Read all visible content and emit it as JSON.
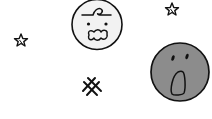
{
  "scene": {
    "background": "#ffffff",
    "stroke_color": "#111111",
    "elements": [
      {
        "type": "face",
        "name": "worried-face",
        "fill": "#f2f2f2",
        "cx": 97,
        "cy": 24,
        "r": 25
      },
      {
        "type": "face",
        "name": "surprised-face",
        "fill": "#8c8c8c",
        "cx": 180,
        "cy": 72,
        "r": 28
      },
      {
        "type": "star",
        "name": "star-left",
        "cx": 21,
        "cy": 40
      },
      {
        "type": "star",
        "name": "star-top-right",
        "cx": 172,
        "cy": 9
      },
      {
        "type": "hash",
        "name": "hash-sparkle",
        "cx": 91,
        "cy": 87
      }
    ]
  }
}
